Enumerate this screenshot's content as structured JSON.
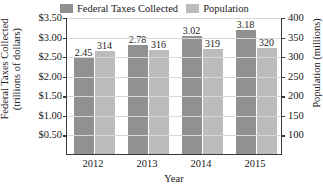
{
  "chart_data": {
    "type": "bar",
    "title": "",
    "categories": [
      "2012",
      "2013",
      "2014",
      "2015"
    ],
    "series": [
      {
        "name": "Federal Taxes Collected",
        "color": "#919191",
        "axis": "left",
        "values": [
          2.45,
          2.78,
          3.02,
          3.18
        ],
        "labels": [
          "2.45",
          "2.78",
          "3.02",
          "3.18"
        ]
      },
      {
        "name": "Population",
        "color": "#bcbcbc",
        "axis": "right",
        "values": [
          314,
          316,
          319,
          320
        ],
        "labels": [
          "314",
          "316",
          "319",
          "320"
        ]
      }
    ],
    "xlabel": "Year",
    "ylabel_left_line1": "Federal Taxes Collected",
    "ylabel_left_line2": "(trillions of dollars)",
    "ylabel_right": "Population (millions)",
    "ylim_left": [
      0.0,
      3.5
    ],
    "ylim_right": [
      50,
      400
    ],
    "yticks_left": [
      "$3.50",
      "$3.00",
      "$2.50",
      "$2.00",
      "$1.50",
      "$1.00",
      "$0.50"
    ],
    "yticks_right": [
      "400",
      "350",
      "300",
      "250",
      "200",
      "150",
      "100"
    ],
    "grid": true,
    "legend_position": "top"
  },
  "legend": {
    "entries": [
      {
        "label": "Federal Taxes Collected"
      },
      {
        "label": "Population"
      }
    ]
  }
}
